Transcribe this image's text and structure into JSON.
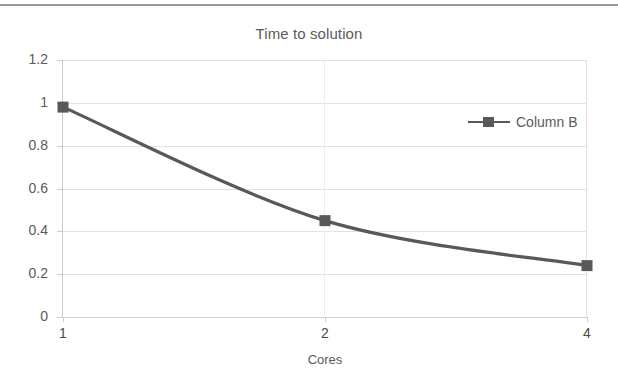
{
  "chart_data": {
    "type": "line",
    "title": "Time to solution",
    "xlabel": "Cores",
    "ylabel": "",
    "categories": [
      "1",
      "2",
      "4"
    ],
    "x": [
      1,
      2,
      4
    ],
    "series": [
      {
        "name": "Column B",
        "values": [
          0.98,
          0.45,
          0.24
        ],
        "color": "#595959",
        "marker": "square",
        "smooth": true
      }
    ],
    "ylim": [
      0,
      1.2
    ],
    "yticks": [
      0,
      0.2,
      0.4,
      0.6,
      0.8,
      1,
      1.2
    ],
    "ytick_labels": [
      "0",
      "0.2",
      "0.4",
      "0.6",
      "0.8",
      "1",
      "1.2"
    ],
    "xtick_labels": [
      "1",
      "2",
      "4"
    ],
    "grid": "horizontal",
    "legend_position": "right-inside",
    "legend_entries": [
      "Column B"
    ]
  },
  "legend": {
    "entries": [
      {
        "label": "Column B",
        "color": "#595959"
      }
    ]
  },
  "axis": {
    "y_labels": [
      "1.2",
      "1",
      "0.8",
      "0.6",
      "0.4",
      "0.2",
      "0"
    ],
    "x_labels": [
      "1",
      "2",
      "4"
    ],
    "x_title": "Cores"
  },
  "colors": {
    "series": "#595959",
    "gridline": "#e2e2e2",
    "text": "#5b5b5b",
    "rule": "#9a9a9a"
  }
}
